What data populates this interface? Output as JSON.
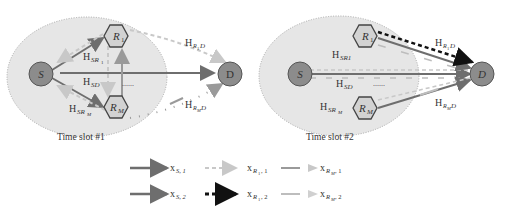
{
  "panels": [
    {
      "caption": "Time slot #1",
      "nodes": {
        "source": "S",
        "destination": "D",
        "relay_1": "R",
        "relay_1_sub": "1",
        "relay_m": "R",
        "relay_m_sub": "M"
      },
      "channels": {
        "h_sr1": "H",
        "h_sr1_sub": "SR",
        "h_sr1_subsub": "1",
        "h_sd": "H",
        "h_sd_sub": "SD",
        "h_srm": "H",
        "h_srm_sub": "SR",
        "h_srm_subsub": "M",
        "h_r1d": "H",
        "h_r1d_sub": "R",
        "h_r1d_subsub": "1",
        "h_r1d_tail": "D",
        "h_rmd": "H",
        "h_rmd_sub": "R",
        "h_rmd_subsub": "M",
        "h_rmd_tail": "D"
      },
      "ellipsis": "......"
    },
    {
      "caption": "Time slot #2",
      "nodes": {
        "source": "S",
        "destination": "D",
        "relay_1": "R",
        "relay_1_sub": "1",
        "relay_m": "R",
        "relay_m_sub": "M"
      },
      "channels": {
        "h_sr1": "H",
        "h_sr1_sub": "SR1",
        "h_sd": "H",
        "h_sd_sub": "SD",
        "h_srm": "H",
        "h_srm_sub": "SR",
        "h_srm_subsub": "M",
        "h_r1d": "H",
        "h_r1d_sub": "R",
        "h_r1d_subsub": "1",
        "h_r1d_tail": "D",
        "h_rmd": "H",
        "h_rmd_sub": "R",
        "h_rmd_subsub": "M",
        "h_rmd_tail": "D"
      },
      "ellipsis": "......"
    }
  ],
  "legend": [
    {
      "symbol": "x",
      "sub": "S, 1",
      "style": "solid-dark"
    },
    {
      "symbol": "x",
      "sub": "R",
      "subsub": "1",
      "tail": ", 1",
      "style": "dashed-light"
    },
    {
      "symbol": "x",
      "sub": "R",
      "subsub": "M",
      "tail": ", 1",
      "style": "solid-mid"
    },
    {
      "symbol": "x",
      "sub": "S, 2",
      "style": "solid-dark"
    },
    {
      "symbol": "x",
      "sub": "R",
      "subsub": "1",
      "tail": ", 2",
      "style": "dashed-black"
    },
    {
      "symbol": "x",
      "sub": "R",
      "subsub": "M",
      "tail": ", 2",
      "style": "solid-light"
    }
  ],
  "colors": {
    "ellipse_fill": "#e6e6e6",
    "node_fill": "#8c8c8c",
    "relay_fill": "#d2d2d2",
    "solid_dark": "#6e6e6e",
    "dashed_light": "#c8c8c8",
    "solid_mid": "#9a9a9a",
    "solid_light": "#bdbdbd",
    "dashed_black": "#111111"
  }
}
